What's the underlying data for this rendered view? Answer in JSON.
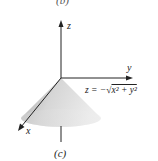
{
  "figure": {
    "top_caption": "(b)",
    "bottom_caption": "(c)",
    "axes": {
      "x_label": "x",
      "y_label": "y",
      "z_label": "z"
    },
    "surface": {
      "type": "cone",
      "equation_prefix": "z = −√",
      "equation_body": "x² + y²",
      "equation": "z = −√(x² + y²)"
    },
    "colors": {
      "axis": "#222222",
      "cone_light": "#e6e6e6",
      "cone_dark": "#9a9a9a"
    }
  }
}
